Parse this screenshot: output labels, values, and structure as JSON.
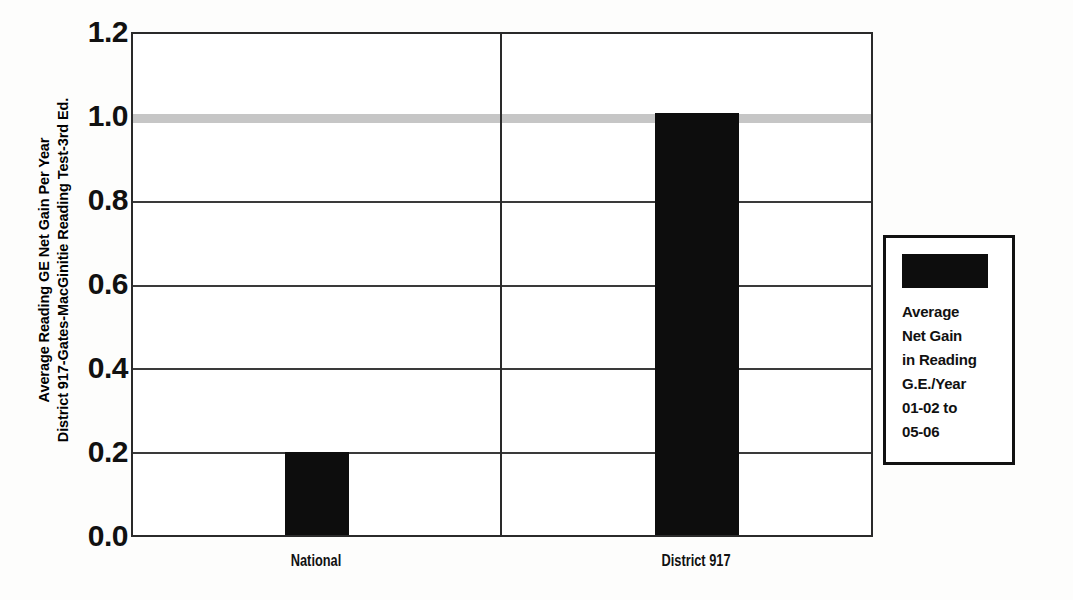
{
  "chart_data": {
    "type": "bar",
    "title": "",
    "categories": [
      "National",
      "District 917"
    ],
    "values": [
      0.2,
      1.01
    ],
    "series": [
      {
        "name": "Average Net Gain in Reading G.E./Year 01-02 to 05-06",
        "values": [
          0.2,
          1.01
        ],
        "color": "#0d0d0d"
      }
    ],
    "xlabel": "",
    "ylabel": "Average Reading GE Net Gain Per Year District 917-Gates-MacGinitie Reading Test-3rd Ed.",
    "ylim": [
      0.0,
      1.2
    ],
    "ytick_labels": [
      "0.0",
      "0.2",
      "0.4",
      "0.6",
      "0.8",
      "1.0",
      "1.2"
    ],
    "ytick_values": [
      0.0,
      0.2,
      0.4,
      0.6,
      0.8,
      1.0,
      1.2
    ],
    "gridlines": [
      0.2,
      0.4,
      0.6,
      0.8
    ],
    "reference_band": {
      "value": 1.0,
      "color": "#c6c6c6"
    },
    "grid": true,
    "legend_position": "right"
  },
  "axis": {
    "y_title_line1": "Average Reading GE Net Gain Per Year",
    "y_title_line2": "District 917-Gates-MacGinitie Reading Test-3rd Ed.",
    "ticks": [
      {
        "label": "1.2",
        "value": 1.2
      },
      {
        "label": "1.0",
        "value": 1.0
      },
      {
        "label": "0.8",
        "value": 0.8
      },
      {
        "label": "0.6",
        "value": 0.6
      },
      {
        "label": "0.4",
        "value": 0.4
      },
      {
        "label": "0.2",
        "value": 0.2
      },
      {
        "label": "0.0",
        "value": 0.0
      }
    ],
    "categories": [
      {
        "label": "National",
        "value": 0.2
      },
      {
        "label": "District 917",
        "value": 1.01
      }
    ]
  },
  "legend": {
    "swatch_color": "#0d0d0d",
    "lines": [
      "Average",
      "Net Gain",
      "in Reading",
      "G.E./Year",
      "01-02 to",
      "05-06"
    ]
  },
  "colors": {
    "bar": "#0d0d0d",
    "band": "#c6c6c6",
    "axis": "#2a2a2a",
    "background": "#fdfdfc"
  }
}
